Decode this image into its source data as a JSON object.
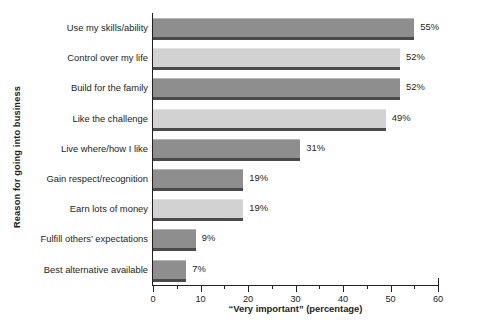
{
  "chart_data": {
    "type": "bar",
    "orientation": "horizontal",
    "title": "",
    "xlabel": "“Very important” (percentage)",
    "ylabel": "Reason for going into business",
    "xlim": [
      0,
      60
    ],
    "xticks": [
      0,
      10,
      20,
      30,
      40,
      50,
      60
    ],
    "xtick_labels": [
      "0",
      "10",
      "20",
      "30",
      "40",
      "50",
      "60"
    ],
    "xminorticks": [
      5,
      15,
      25,
      35,
      45,
      55
    ],
    "grid": false,
    "legend": null,
    "value_suffix": "%",
    "categories": [
      "Use my skills/ability",
      "Control over my life",
      "Build for the family",
      "Like the challenge",
      "Live where/how I like",
      "Gain respect/recognition",
      "Earn lots of money",
      "Fulfill others’ expectations",
      "Best alternative available"
    ],
    "values": [
      55,
      52,
      52,
      49,
      31,
      19,
      19,
      9,
      7
    ],
    "value_labels": [
      "55%",
      "52%",
      "52%",
      "49%",
      "31%",
      "19%",
      "19%",
      "9%",
      "7%"
    ],
    "bar_shades": [
      "dark",
      "light",
      "dark",
      "light",
      "dark",
      "dark",
      "light",
      "dark",
      "dark"
    ],
    "colors": {
      "bar_dark": "#8e8e8e",
      "bar_light": "#d2d2d2",
      "bar_shadow": "#4a4a4a",
      "axis": "#231f20",
      "text": "#231f20",
      "background": "#ffffff"
    }
  }
}
